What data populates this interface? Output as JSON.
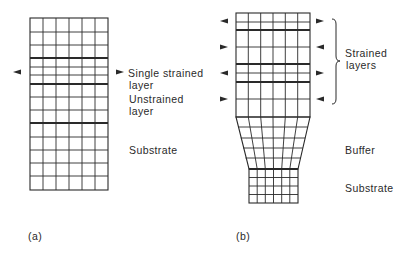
{
  "panel_a": {
    "caption": "(a)",
    "labels": {
      "single_strained_1": "Single strained",
      "single_strained_2": "layer",
      "unstrained_1": "Unstrained",
      "unstrained_2": "layer",
      "substrate": "Substrate"
    }
  },
  "panel_b": {
    "caption": "(b)",
    "labels": {
      "strained_1": "Strained",
      "strained_2": "layers",
      "buffer": "Buffer",
      "substrate": "Substrate"
    }
  },
  "colors": {
    "line": "#2a2a2a",
    "text": "#2a2a2a",
    "background": "#ffffff"
  }
}
